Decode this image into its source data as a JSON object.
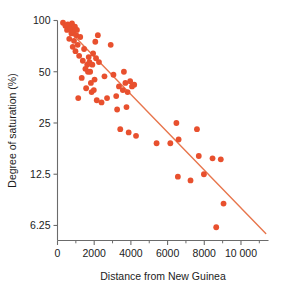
{
  "chart_data": {
    "type": "scatter",
    "title": "",
    "xlabel": "Distance from New Guinea",
    "ylabel": "Degree of saturation (%)",
    "xlim": [
      0,
      11500
    ],
    "ylim": [
      5.1,
      100
    ],
    "yscale": "log2",
    "grid": false,
    "legend": null,
    "xticks": [
      0,
      2000,
      4000,
      6000,
      8000,
      10000
    ],
    "xticklabels": [
      "0",
      "2000",
      "4000",
      "6000",
      "8000",
      "10 000"
    ],
    "xminorticks": [
      1000,
      3000,
      5000,
      7000,
      9000,
      11000
    ],
    "yticks": [
      100,
      50,
      25,
      12.5,
      6.25
    ],
    "yticklabels": [
      "100",
      "50",
      "25",
      "12.5",
      "6.25"
    ],
    "point_color": "#e8502e",
    "line_color": "#e8764d",
    "axis_color": "#6b6b6b",
    "trendline": {
      "x0": 250,
      "y0": 96,
      "x1": 11350,
      "y1": 5.6
    },
    "points": [
      {
        "x": 300,
        "y": 97
      },
      {
        "x": 430,
        "y": 93
      },
      {
        "x": 520,
        "y": 88
      },
      {
        "x": 560,
        "y": 95
      },
      {
        "x": 640,
        "y": 78
      },
      {
        "x": 700,
        "y": 90
      },
      {
        "x": 760,
        "y": 84
      },
      {
        "x": 790,
        "y": 96
      },
      {
        "x": 830,
        "y": 70
      },
      {
        "x": 870,
        "y": 86
      },
      {
        "x": 900,
        "y": 76
      },
      {
        "x": 950,
        "y": 92
      },
      {
        "x": 980,
        "y": 66
      },
      {
        "x": 1020,
        "y": 82
      },
      {
        "x": 1060,
        "y": 88
      },
      {
        "x": 1100,
        "y": 72
      },
      {
        "x": 1130,
        "y": 35
      },
      {
        "x": 1180,
        "y": 62
      },
      {
        "x": 1240,
        "y": 80
      },
      {
        "x": 1320,
        "y": 46
      },
      {
        "x": 1380,
        "y": 58
      },
      {
        "x": 1450,
        "y": 68
      },
      {
        "x": 1520,
        "y": 52
      },
      {
        "x": 1560,
        "y": 40
      },
      {
        "x": 1620,
        "y": 55
      },
      {
        "x": 1660,
        "y": 50
      },
      {
        "x": 1700,
        "y": 61
      },
      {
        "x": 1740,
        "y": 57
      },
      {
        "x": 1780,
        "y": 50
      },
      {
        "x": 1820,
        "y": 43
      },
      {
        "x": 1860,
        "y": 38
      },
      {
        "x": 1900,
        "y": 55
      },
      {
        "x": 1940,
        "y": 64
      },
      {
        "x": 1980,
        "y": 39
      },
      {
        "x": 2020,
        "y": 45
      },
      {
        "x": 2060,
        "y": 75
      },
      {
        "x": 2100,
        "y": 60
      },
      {
        "x": 2140,
        "y": 34
      },
      {
        "x": 2200,
        "y": 82
      },
      {
        "x": 2260,
        "y": 57
      },
      {
        "x": 2400,
        "y": 33
      },
      {
        "x": 2560,
        "y": 47
      },
      {
        "x": 2700,
        "y": 35
      },
      {
        "x": 2900,
        "y": 72
      },
      {
        "x": 3050,
        "y": 48
      },
      {
        "x": 3200,
        "y": 36
      },
      {
        "x": 3250,
        "y": 30
      },
      {
        "x": 3350,
        "y": 41
      },
      {
        "x": 3420,
        "y": 23
      },
      {
        "x": 3560,
        "y": 39
      },
      {
        "x": 3620,
        "y": 50
      },
      {
        "x": 3700,
        "y": 43
      },
      {
        "x": 3760,
        "y": 31
      },
      {
        "x": 3820,
        "y": 38
      },
      {
        "x": 3880,
        "y": 22
      },
      {
        "x": 3960,
        "y": 44
      },
      {
        "x": 4060,
        "y": 41
      },
      {
        "x": 4180,
        "y": 42
      },
      {
        "x": 4280,
        "y": 21
      },
      {
        "x": 5400,
        "y": 19
      },
      {
        "x": 6150,
        "y": 19
      },
      {
        "x": 6480,
        "y": 25
      },
      {
        "x": 6560,
        "y": 12.1
      },
      {
        "x": 6600,
        "y": 20
      },
      {
        "x": 7250,
        "y": 11.5
      },
      {
        "x": 7600,
        "y": 23
      },
      {
        "x": 7700,
        "y": 16
      },
      {
        "x": 7980,
        "y": 12.5
      },
      {
        "x": 8450,
        "y": 15.5
      },
      {
        "x": 8650,
        "y": 6.1
      },
      {
        "x": 8900,
        "y": 15.3
      },
      {
        "x": 9050,
        "y": 8.4
      }
    ]
  }
}
